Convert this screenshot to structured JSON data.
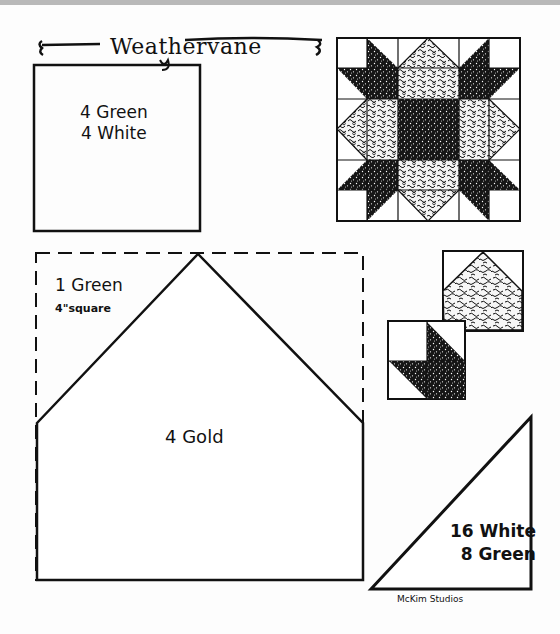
{
  "pattern": {
    "title": "Weathervane",
    "publisher_credit": "McKim Studios",
    "colors": {
      "ink": "#111111",
      "paper": "#fdfdfd",
      "top_bar": "#b9b9b9"
    }
  },
  "templates": [
    {
      "id": "square",
      "shape": "square",
      "cut_lines": [
        "4 Green",
        "4 White"
      ]
    },
    {
      "id": "green-square",
      "shape": "dashed square",
      "cut_lines": [
        "1 Green",
        "4\"square"
      ]
    },
    {
      "id": "pentagon",
      "shape": "house pentagon",
      "cut_lines": [
        "4 Gold"
      ]
    },
    {
      "id": "triangle",
      "shape": "right triangle",
      "cut_lines": [
        "16 White",
        "8 Green"
      ]
    }
  ],
  "illustrations": {
    "block_preview": "Weathervane full block (6x6 grid, star pattern)",
    "unit_previews": [
      "pentagon unit in square",
      "corner half-square triangle unit"
    ]
  }
}
